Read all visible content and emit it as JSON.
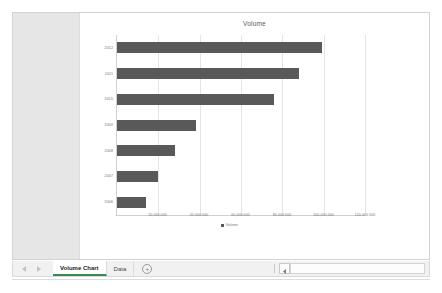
{
  "window": {
    "sheet_pane_label": ""
  },
  "chart": {
    "title": "Volume",
    "legend_label": "Volume",
    "series_color": "#595959",
    "gridline_color": "#e4e4e4",
    "axis_color": "#d0d0d0"
  },
  "chart_buttons": [
    {
      "name": "chart-elements-button",
      "icon": "plus-icon",
      "tooltip": "Chart Elements"
    },
    {
      "name": "chart-styles-button",
      "icon": "paintbrush-icon",
      "tooltip": "Chart Styles"
    },
    {
      "name": "chart-filters-button",
      "icon": "funnel-icon",
      "tooltip": "Chart Filters"
    }
  ],
  "tabbar": {
    "prev_icon": "triangle-left-icon",
    "next_icon": "triangle-right-icon",
    "add_sheet_icon": "plus-icon",
    "add_sheet_label": "+",
    "scroll_left_icon": "triangle-left-icon",
    "tabs": [
      {
        "label": "Volume Chart",
        "active": true
      },
      {
        "label": "Data",
        "active": false
      }
    ]
  },
  "chart_data": {
    "type": "bar",
    "orientation": "horizontal",
    "title": "Volume",
    "xlabel": "",
    "ylabel": "",
    "categories": [
      "2012",
      "2011",
      "2010",
      "2009",
      "2008",
      "2007",
      "2006"
    ],
    "values": [
      99000000,
      88000000,
      76000000,
      38000000,
      28000000,
      20000000,
      14000000
    ],
    "series": [
      {
        "name": "Volume",
        "values": [
          99000000,
          88000000,
          76000000,
          38000000,
          28000000,
          20000000,
          14000000
        ]
      }
    ],
    "xlim": [
      0,
      120000000
    ],
    "xticks": [
      0,
      20000000,
      40000000,
      60000000,
      80000000,
      100000000,
      120000000
    ],
    "xtick_labels": [
      "-",
      "20,000,000",
      "40,000,000",
      "60,000,000",
      "80,000,000",
      "100,000,000",
      "120,000,000"
    ],
    "grid": true,
    "grid_axis": "x",
    "legend": true,
    "legend_position": "bottom"
  }
}
